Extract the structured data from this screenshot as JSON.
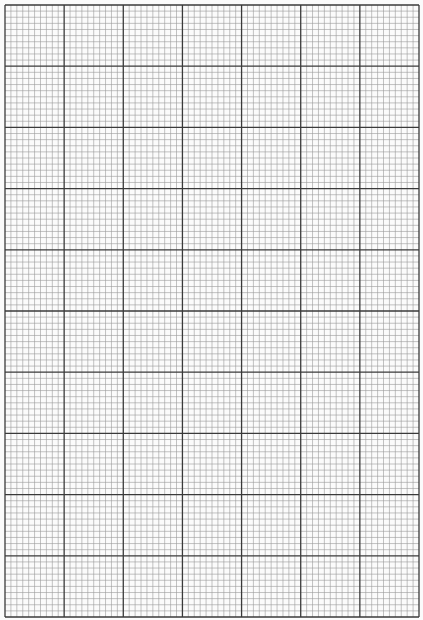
{
  "page": {
    "type": "graph-paper",
    "major_columns": 7,
    "major_rows": 10,
    "minor_per_major": 10,
    "grid_left": 5,
    "grid_top": 5,
    "grid_right": 419,
    "grid_bottom": 617,
    "colors": {
      "paper": "#fbfbfb",
      "minor_line": "#9a9a9a",
      "major_line": "#3a3a3a"
    }
  }
}
